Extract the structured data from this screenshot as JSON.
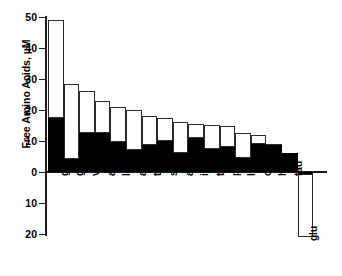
{
  "chart_data": {
    "type": "bar",
    "title": "",
    "subtitle": "",
    "xlabel": "",
    "ylabel": "Free Amino Acids, µM",
    "ylim": [
      -22,
      50
    ],
    "yticks": [
      50,
      40,
      30,
      20,
      10,
      0,
      10,
      20
    ],
    "ytick_labels": [
      "50",
      "40",
      "30",
      "20",
      "10",
      "0",
      "10",
      "20"
    ],
    "grid": false,
    "legend": [],
    "legend_position": "none",
    "note": "Stacked bars: filled (black) lower segment plus open (white) upper segment; total bar height is the full value. The 'glu' bar is plotted below the zero baseline.",
    "categories": [
      "gln",
      "gly",
      "val",
      "ala",
      "leu",
      "arg",
      "thr",
      "ser",
      "asn",
      "ile",
      "tyr",
      "phe",
      "lys",
      "orn",
      "his",
      "tau",
      "glu"
    ],
    "values": [
      49,
      28.5,
      26,
      23,
      21,
      19.8,
      18,
      17.5,
      16,
      15.5,
      15,
      14.8,
      12.5,
      11.8,
      9,
      6,
      -21
    ],
    "series": [
      {
        "name": "filled",
        "values": [
          17.5,
          4,
          12.5,
          12.5,
          9.5,
          7,
          8.5,
          10,
          6,
          11,
          7.5,
          8,
          4.5,
          9,
          8.5,
          6,
          -0.6
        ]
      },
      {
        "name": "open",
        "values": [
          31.5,
          24.5,
          13.5,
          10.5,
          11.5,
          12.8,
          9.5,
          7.5,
          10,
          4.5,
          7.5,
          6.8,
          8,
          2.8,
          0.5,
          0,
          -20.4
        ]
      }
    ]
  },
  "axis": {
    "y_title": "Free Amino Acids, µM"
  }
}
